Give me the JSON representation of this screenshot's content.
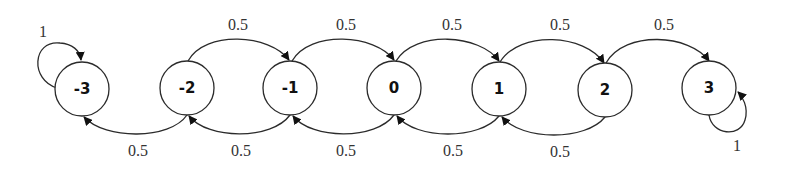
{
  "diagram": {
    "type": "markov-chain",
    "nodes": [
      {
        "id": "-3",
        "label": "-3",
        "cx": 82,
        "cy": 89,
        "rx": 27,
        "ry": 27
      },
      {
        "id": "-2",
        "label": "-2",
        "cx": 187,
        "cy": 88,
        "rx": 27,
        "ry": 27
      },
      {
        "id": "-1",
        "label": "-1",
        "cx": 290,
        "cy": 88,
        "rx": 27,
        "ry": 27
      },
      {
        "id": "0",
        "label": "0",
        "cx": 394,
        "cy": 88,
        "rx": 27,
        "ry": 27
      },
      {
        "id": "1",
        "label": "1",
        "cx": 499,
        "cy": 89,
        "rx": 27,
        "ry": 27
      },
      {
        "id": "2",
        "label": "2",
        "cx": 605,
        "cy": 90,
        "rx": 27,
        "ry": 27
      },
      {
        "id": "3",
        "label": "3",
        "cx": 709,
        "cy": 88,
        "rx": 27,
        "ry": 27
      }
    ],
    "edges_forward": [
      {
        "from": "-2",
        "to": "-1",
        "label": "0.5"
      },
      {
        "from": "-1",
        "to": "0",
        "label": "0.5"
      },
      {
        "from": "0",
        "to": "1",
        "label": "0.5"
      },
      {
        "from": "1",
        "to": "2",
        "label": "0.5"
      },
      {
        "from": "2",
        "to": "3",
        "label": "0.5"
      }
    ],
    "edges_backward": [
      {
        "from": "-2",
        "to": "-3",
        "label": "0.5"
      },
      {
        "from": "-1",
        "to": "-2",
        "label": "0.5"
      },
      {
        "from": "0",
        "to": "-1",
        "label": "0.5"
      },
      {
        "from": "1",
        "to": "0",
        "label": "0.5"
      },
      {
        "from": "2",
        "to": "1",
        "label": "0.5"
      }
    ],
    "self_loops": [
      {
        "node": "-3",
        "label": "1"
      },
      {
        "node": "3",
        "label": "1"
      }
    ]
  }
}
